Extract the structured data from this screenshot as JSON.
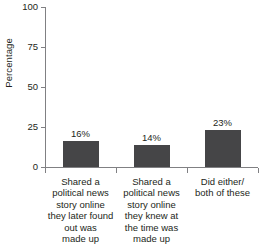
{
  "chart_data": {
    "type": "bar",
    "title": "",
    "xlabel": "",
    "ylabel": "Percentage",
    "ylim": [
      0,
      100
    ],
    "yticks": [
      0,
      25,
      50,
      75,
      100
    ],
    "grid": false,
    "legend": null,
    "bar_color": "#454547",
    "axis_color": "#808083",
    "categories": [
      "Shared a political news story online they later found out was made up",
      "Shared a political news story online they knew at the time was made up",
      "Did either/ both of these"
    ],
    "category_lines": [
      [
        "Shared a",
        "political news",
        "story online",
        "they later found",
        "out was",
        "made up"
      ],
      [
        "Shared a",
        "political news",
        "story online",
        "they knew at",
        "the time was",
        "made up"
      ],
      [
        "Did either/",
        "both of these"
      ]
    ],
    "values": [
      16,
      14,
      23
    ],
    "value_labels": [
      "16%",
      "14%",
      "23%"
    ]
  },
  "axis": {
    "y_title": "Percentage",
    "y_tick_labels": {
      "t100": "100",
      "t75": "75",
      "t50": "50",
      "t25": "25",
      "t0": "0"
    }
  }
}
